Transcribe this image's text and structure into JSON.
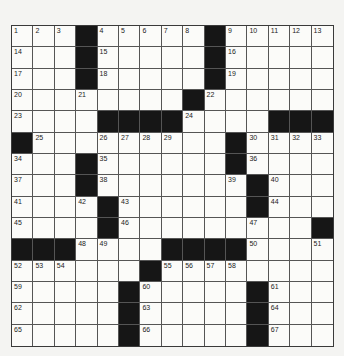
{
  "puzzle": {
    "rows": 15,
    "cols": 15,
    "grid": [
      [
        "1",
        "2",
        "3",
        "#",
        "4",
        "5",
        "6",
        "7",
        "8",
        "#",
        "9",
        "10",
        "11",
        "12",
        "13"
      ],
      [
        "14",
        "",
        "",
        "#",
        "15",
        "",
        "",
        "",
        "",
        "#",
        "16",
        "",
        "",
        "",
        ""
      ],
      [
        "17",
        "",
        "",
        "#",
        "18",
        "",
        "",
        "",
        "",
        "#",
        "19",
        "",
        "",
        "",
        ""
      ],
      [
        "20",
        "",
        "",
        "21",
        "",
        "",
        "",
        "",
        "#",
        "22",
        "",
        "",
        "",
        "",
        ""
      ],
      [
        "23",
        "",
        "",
        "",
        "#",
        "#",
        "#",
        "#",
        "24",
        "",
        "",
        "",
        "#",
        "#",
        "#"
      ],
      [
        "#",
        "25",
        "",
        "",
        "26",
        "27",
        "28",
        "29",
        "",
        "",
        "#",
        "30",
        "31",
        "32",
        "33"
      ],
      [
        "34",
        "",
        "",
        "#",
        "35",
        "",
        "",
        "",
        "",
        "",
        "#",
        "36",
        "",
        "",
        ""
      ],
      [
        "37",
        "",
        "",
        "#",
        "38",
        "",
        "",
        "",
        "",
        "",
        "39",
        "#",
        "40",
        "",
        ""
      ],
      [
        "41",
        "",
        "",
        "42",
        "#",
        "43",
        "",
        "",
        "",
        "",
        "",
        "#",
        "44",
        "",
        ""
      ],
      [
        "45",
        "",
        "",
        "",
        "#",
        "46",
        "",
        "",
        "",
        "",
        "",
        "47",
        "",
        "",
        "#"
      ],
      [
        "#",
        "#",
        "#",
        "48",
        "49",
        "",
        "",
        "#",
        "#",
        "#",
        "#",
        "50",
        "",
        "",
        "51"
      ],
      [
        "52",
        "53",
        "54",
        "",
        "",
        "",
        "#",
        "55",
        "56",
        "57",
        "58",
        "",
        "",
        "",
        ""
      ],
      [
        "59",
        "",
        "",
        "",
        "",
        "#",
        "60",
        "",
        "",
        "",
        "",
        "#",
        "61",
        "",
        ""
      ],
      [
        "62",
        "",
        "",
        "",
        "",
        "#",
        "63",
        "",
        "",
        "",
        "",
        "#",
        "64",
        "",
        ""
      ],
      [
        "65",
        "",
        "",
        "",
        "",
        "#",
        "66",
        "",
        "",
        "",
        "",
        "#",
        "67",
        "",
        ""
      ]
    ]
  },
  "colors": {
    "black_square": "#161616",
    "cell": "#fbfbf9",
    "line": "#555555",
    "background": "#f4f4f2"
  }
}
